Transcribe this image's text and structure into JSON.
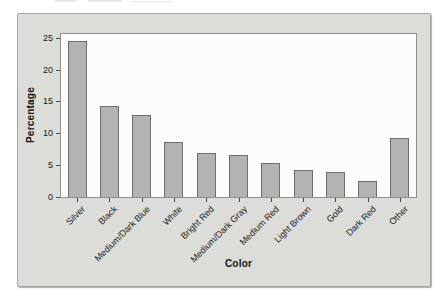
{
  "style": {
    "page_bg": "#ffffff",
    "figure_bg": "#dcddd8",
    "figure_border": "#a3a3a0",
    "plot_bg": "#fcfcfa",
    "plot_border": "#8f8f8b",
    "bar_fill": "#b3b3b1",
    "bar_border": "#6e6e6c",
    "tick_color": "#4a4a48",
    "text_color": "#1b1b1b"
  },
  "chart_data": {
    "type": "bar",
    "title": "",
    "xlabel": "Color",
    "ylabel": "Percentage",
    "categories": [
      "Silver",
      "Black",
      "Medium/Dark Blue",
      "White",
      "Bright Red",
      "Medium/Dark Gray",
      "Medium Red",
      "Light Brown",
      "Gold",
      "Dark Red",
      "Other"
    ],
    "values": [
      24.5,
      14.3,
      12.8,
      8.7,
      6.9,
      6.6,
      5.4,
      4.3,
      4.0,
      2.5,
      9.3
    ],
    "ylim": [
      0,
      25
    ],
    "yticks": [
      0,
      5,
      10,
      15,
      20,
      25
    ],
    "grid": false,
    "legend_position": "none",
    "bar_orientation": "vertical"
  }
}
